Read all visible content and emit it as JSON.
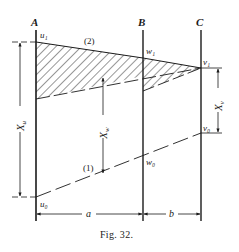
{
  "figure": {
    "caption": "Fig. 32.",
    "verticals": [
      {
        "label": "A",
        "x": 36
      },
      {
        "label": "B",
        "x": 143
      },
      {
        "label": "C",
        "x": 201
      }
    ],
    "points": {
      "u1": "u₁",
      "w1": "w₁",
      "v1": "v₁",
      "u0": "u₀",
      "w0": "w₀",
      "v0": "v₀"
    },
    "line_labels": {
      "line1": "(1)",
      "line2": "(2)"
    },
    "dimensions": {
      "Xu": {
        "main": "X",
        "sub": "u"
      },
      "Xw": {
        "main": "X",
        "sub": "w"
      },
      "Xv": {
        "main": "X",
        "sub": "v"
      },
      "a": "a",
      "b": "b"
    },
    "colors": {
      "ink": "#1a1a1a",
      "background": "#ffffff"
    }
  }
}
